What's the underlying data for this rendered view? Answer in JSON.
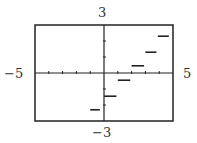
{
  "chart_data": {
    "type": "line",
    "subtype": "step-function",
    "title": "",
    "xlabel": "",
    "ylabel": "",
    "xlim": [
      -5,
      5
    ],
    "ylim": [
      -3,
      3
    ],
    "window_labels": {
      "xmin": "−5",
      "xmax": "5",
      "ymin": "−3",
      "ymax": "3"
    },
    "x_ticks": [
      -4,
      -3,
      -2,
      -1,
      1,
      2,
      3,
      4
    ],
    "y_ticks": [
      -2,
      -1,
      1,
      2
    ],
    "grid": false,
    "legend": null,
    "values_are_estimates": true,
    "series": [
      {
        "name": "step segments",
        "color": "#222222",
        "segments": [
          {
            "x0": -1.0,
            "x1": -0.3,
            "y": -2.3
          },
          {
            "x0": 0.0,
            "x1": 0.9,
            "y": -1.45
          },
          {
            "x0": 1.0,
            "x1": 1.9,
            "y": -0.45
          },
          {
            "x0": 2.0,
            "x1": 2.9,
            "y": 0.45
          },
          {
            "x0": 3.0,
            "x1": 3.8,
            "y": 1.3
          },
          {
            "x0": 3.9,
            "x1": 4.7,
            "y": 2.3
          }
        ]
      }
    ]
  },
  "layout": {
    "frame": {
      "left": 35,
      "top": 25,
      "right": 173,
      "bottom": 121
    },
    "axis_color": "#222222",
    "frame_color": "#222222"
  }
}
